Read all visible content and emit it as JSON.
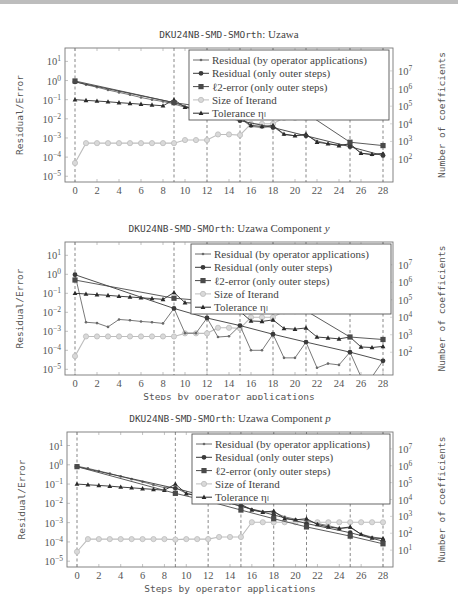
{
  "chart_data": [
    {
      "type": "line",
      "title_mono": "DKU24NB-SMD-SMOrth",
      "title_rest": ": Uzawa",
      "xlabel": "Steps by operator applications",
      "ylabel": "Residual/Error",
      "ylabel_right": "Number of coefficients",
      "x_ticks": [
        "0",
        "2",
        "4",
        "6",
        "8",
        "10",
        "12",
        "14",
        "16",
        "18",
        "20",
        "22",
        "24",
        "26",
        "28"
      ],
      "y_ticks": [
        "10^1",
        "10^0",
        "10^-1",
        "10^-2",
        "10^-3",
        "10^-4",
        "10^-5"
      ],
      "y2_ticks": [
        "10^7",
        "10^6",
        "10^5",
        "10^4",
        "10^3",
        "10^2"
      ],
      "ylim_exp": [
        -5.3,
        1.7
      ],
      "y2lim_exp": [
        0.7,
        8.3
      ],
      "xlim": [
        -0.6,
        28.6
      ],
      "yscale": "log",
      "outer_steps": [
        0,
        9,
        12,
        15,
        18,
        21,
        25,
        28
      ],
      "legend_position": "top-right",
      "legend": [
        "Residual (by operator applications)",
        "Residual (only outer steps)",
        "ℓ2-error (only outer steps)",
        "Size of Iterand",
        "Tolerance ηₗ"
      ],
      "series": [
        {
          "name": "Residual (by operator applications)",
          "marker": "star",
          "axis": "left",
          "x": [
            0,
            1,
            2,
            3,
            4,
            5,
            6,
            7,
            8,
            9,
            10,
            11,
            12,
            13,
            14,
            15,
            16,
            17,
            18,
            19,
            20,
            21,
            22,
            23,
            24,
            25,
            26,
            27,
            28
          ],
          "values": [
            0.9,
            0.6,
            0.45,
            0.32,
            0.24,
            0.18,
            0.13,
            0.1,
            0.08,
            0.06,
            0.04,
            0.03,
            0.025,
            0.018,
            0.014,
            0.011,
            0.004,
            0.0035,
            0.004,
            0.0015,
            0.0013,
            0.0014,
            0.0007,
            0.0005,
            0.00042,
            0.00045,
            0.00016,
            0.00013,
            0.00016
          ]
        },
        {
          "name": "Residual (only outer steps)",
          "marker": "circle",
          "axis": "left",
          "x": [
            0,
            9,
            12,
            15,
            18,
            21,
            25,
            28
          ],
          "values": [
            0.85,
            0.07,
            0.02,
            0.008,
            0.0035,
            0.0013,
            0.00035,
            0.00012
          ]
        },
        {
          "name": "ℓ2-error (only outer steps)",
          "marker": "square",
          "axis": "left",
          "x": [
            0,
            9,
            12,
            15,
            18,
            21,
            25,
            28
          ],
          "values": [
            0.95,
            0.07,
            0.04,
            0.04,
            0.035,
            0.02,
            0.0006,
            0.0004
          ]
        },
        {
          "name": "Size of Iterand",
          "marker": "circle-open",
          "axis": "right",
          "x": [
            0,
            1,
            2,
            3,
            4,
            5,
            6,
            7,
            8,
            9,
            10,
            11,
            12,
            13,
            14,
            15,
            16,
            17,
            18,
            19,
            20,
            21
          ],
          "values": [
            60,
            800,
            800,
            800,
            800,
            800,
            800,
            800,
            800,
            800,
            1200,
            1200,
            1200,
            2500,
            2500,
            2300,
            10000,
            10000,
            10000,
            22000,
            22000,
            22000
          ]
        },
        {
          "name": "Tolerance ηₗ",
          "marker": "triangle",
          "axis": "left",
          "x": [
            0,
            1,
            2,
            3,
            4,
            5,
            6,
            7,
            8,
            9,
            10,
            11,
            12,
            13,
            14,
            15,
            16,
            17,
            18,
            19,
            20,
            21,
            22,
            23,
            24,
            25,
            26,
            27,
            28
          ],
          "values": [
            0.1,
            0.092,
            0.085,
            0.078,
            0.07,
            0.064,
            0.058,
            0.053,
            0.048,
            0.1,
            0.04,
            0.035,
            0.03,
            0.022,
            0.016,
            0.012,
            0.0045,
            0.004,
            0.0045,
            0.0016,
            0.0013,
            0.0016,
            0.0006,
            0.0005,
            0.0004,
            0.0005,
            0.00016,
            0.00014,
            0.00015
          ]
        }
      ]
    },
    {
      "type": "line",
      "title_mono": "DKU24NB-SMD-SMOrth",
      "title_rest": ": Uzawa Component ",
      "title_var": "y",
      "xlabel": "Steps by operator applications",
      "ylabel": "Residual/Error",
      "ylabel_right": "Number of coefficients",
      "x_ticks": [
        "0",
        "2",
        "4",
        "6",
        "8",
        "10",
        "12",
        "14",
        "16",
        "18",
        "20",
        "22",
        "24",
        "26",
        "28"
      ],
      "y_ticks": [
        "10^1",
        "10^0",
        "10^-1",
        "10^-2",
        "10^-3",
        "10^-4",
        "10^-5"
      ],
      "y2_ticks": [
        "10^7",
        "10^6",
        "10^5",
        "10^4",
        "10^3",
        "10^2"
      ],
      "ylim_exp": [
        -5.3,
        1.7
      ],
      "y2lim_exp": [
        0.7,
        8.3
      ],
      "xlim": [
        -0.6,
        28.6
      ],
      "yscale": "log",
      "outer_steps": [
        0,
        9,
        12,
        15,
        18,
        21,
        25,
        28
      ],
      "legend_position": "top-right",
      "legend": [
        "Residual (by operator applications)",
        "Residual (only outer steps)",
        "ℓ2-error (only outer steps)",
        "Size of Iterand",
        "Tolerance ηₗ"
      ],
      "series": [
        {
          "name": "Residual (by operator applications)",
          "marker": "star",
          "axis": "left",
          "x": [
            0,
            1,
            2,
            3,
            4,
            5,
            6,
            7,
            8,
            9,
            10,
            11,
            12,
            13,
            14,
            15,
            16,
            17,
            18,
            19,
            20,
            21,
            22,
            23,
            24,
            25,
            26,
            27,
            28
          ],
          "values": [
            0.95,
            0.003,
            0.0027,
            0.0017,
            0.0042,
            0.0038,
            0.0033,
            0.003,
            0.0026,
            0.016,
            0.0008,
            0.0008,
            0.005,
            0.0005,
            0.00055,
            0.002,
            0.0001,
            0.0001,
            0.0007,
            4e-05,
            4e-05,
            0.00027,
            1.2e-05,
            2e-05,
            1.7e-05,
            8e-05,
            4e-06,
            4e-06,
            2.8e-05
          ]
        },
        {
          "name": "Residual (only outer steps)",
          "marker": "circle",
          "axis": "left",
          "x": [
            0,
            9,
            12,
            15,
            18,
            21,
            25,
            28
          ],
          "values": [
            0.95,
            0.016,
            0.005,
            0.002,
            0.0007,
            0.00027,
            8e-05,
            2.8e-05
          ]
        },
        {
          "name": "ℓ2-error (only outer steps)",
          "marker": "square",
          "axis": "left",
          "x": [
            0,
            9,
            12,
            15,
            18,
            21,
            25,
            28
          ],
          "values": [
            0.5,
            0.055,
            0.04,
            0.03,
            0.025,
            0.012,
            0.0005,
            0.00037
          ]
        },
        {
          "name": "Size of Iterand",
          "marker": "circle-open",
          "axis": "right",
          "x": [
            0,
            1,
            2,
            3,
            4,
            5,
            6,
            7,
            8,
            9,
            10,
            11,
            12,
            13,
            14,
            15,
            16,
            17,
            18,
            19,
            20,
            21
          ],
          "values": [
            60,
            800,
            800,
            800,
            800,
            800,
            800,
            800,
            800,
            800,
            1200,
            1200,
            1200,
            2500,
            2500,
            2300,
            10000,
            10000,
            10000,
            22000,
            22000,
            22000
          ]
        },
        {
          "name": "Tolerance ηₗ",
          "marker": "triangle",
          "axis": "left",
          "x": [
            0,
            1,
            2,
            3,
            4,
            5,
            6,
            7,
            8,
            9,
            10,
            11,
            12,
            13,
            14,
            15,
            16,
            17,
            18,
            19,
            20,
            21,
            22,
            23,
            24,
            25,
            26,
            27,
            28
          ],
          "values": [
            0.1,
            0.092,
            0.085,
            0.078,
            0.07,
            0.064,
            0.058,
            0.053,
            0.048,
            0.11,
            0.032,
            0.03,
            0.028,
            0.02,
            0.015,
            0.011,
            0.0035,
            0.0033,
            0.004,
            0.0014,
            0.0013,
            0.0015,
            0.0005,
            0.00045,
            0.0004,
            0.0005,
            0.00015,
            0.00014,
            0.00016
          ]
        }
      ]
    },
    {
      "type": "line",
      "title_mono": "DKU24NB-SMD-SMOrth",
      "title_rest": ": Uzawa Component ",
      "title_var": "p",
      "xlabel": "Steps by operator applications",
      "ylabel": "Residual/Error",
      "ylabel_right": "Number of coefficients",
      "x_ticks": [
        "0",
        "2",
        "4",
        "6",
        "8",
        "10",
        "12",
        "14",
        "16",
        "18",
        "20",
        "22",
        "24",
        "26",
        "28"
      ],
      "y_ticks": [
        "10^1",
        "10^0",
        "10^-1",
        "10^-2",
        "10^-3",
        "10^-4",
        "10^-5"
      ],
      "y2_ticks": [
        "10^7",
        "10^6",
        "10^5",
        "10^4",
        "10^3",
        "10^2",
        "10^1"
      ],
      "ylim_exp": [
        -5.3,
        1.7
      ],
      "y2lim_exp": [
        0.0,
        8.0
      ],
      "xlim": [
        -0.6,
        28.6
      ],
      "yscale": "log",
      "outer_steps": [
        0,
        9,
        12,
        15,
        18,
        21,
        25,
        28
      ],
      "legend_position": "top-right",
      "legend": [
        "Residual (by operator applications)",
        "Residual (only outer steps)",
        "ℓ2-error (only outer steps)",
        "Size of Iterand",
        "Tolerance ηₗ"
      ],
      "series": [
        {
          "name": "Residual (by operator applications)",
          "marker": "star",
          "axis": "left",
          "x": [
            0,
            1,
            2,
            3,
            4,
            5,
            6,
            7,
            8,
            9,
            10,
            11,
            12,
            13,
            14,
            15,
            16,
            17,
            18,
            19,
            20,
            21,
            22,
            23,
            24,
            25,
            26,
            27,
            28
          ],
          "values": [
            0.85,
            0.65,
            0.48,
            0.35,
            0.25,
            0.18,
            0.13,
            0.09,
            0.065,
            0.065,
            0.033,
            0.025,
            0.019,
            0.014,
            0.01,
            0.0075,
            0.005,
            0.0038,
            0.0035,
            0.002,
            0.0015,
            0.0013,
            0.0009,
            0.0007,
            0.0005,
            0.00055,
            0.00025,
            0.00018,
            0.00015
          ]
        },
        {
          "name": "Residual (only outer steps)",
          "marker": "circle",
          "axis": "left",
          "x": [
            0,
            9,
            12,
            15,
            18,
            21,
            25,
            28
          ],
          "values": [
            0.8,
            0.06,
            0.022,
            0.007,
            0.0025,
            0.0009,
            0.0003,
            0.00011
          ]
        },
        {
          "name": "ℓ2-error (only outer steps)",
          "marker": "square",
          "axis": "left",
          "x": [
            0,
            9,
            12,
            15,
            18,
            21,
            25,
            28
          ],
          "values": [
            0.8,
            0.033,
            0.013,
            0.0045,
            0.0016,
            0.0006,
            0.0002,
            8e-05
          ]
        },
        {
          "name": "Size of Iterand",
          "marker": "circle-open",
          "axis": "right",
          "x": [
            0,
            1,
            2,
            3,
            4,
            5,
            6,
            7,
            8,
            9,
            10,
            11,
            12,
            13,
            14,
            15,
            16,
            17,
            18,
            19,
            20,
            21,
            22,
            23,
            24,
            25,
            26,
            27,
            28
          ],
          "values": [
            8,
            45,
            45,
            45,
            45,
            45,
            45,
            45,
            45,
            42,
            45,
            45,
            45,
            60,
            60,
            60,
            450,
            450,
            450,
            450,
            450,
            450,
            450,
            450,
            450,
            450,
            450,
            450,
            450
          ]
        },
        {
          "name": "Tolerance ηₗ",
          "marker": "triangle",
          "axis": "left",
          "x": [
            0,
            1,
            2,
            3,
            4,
            5,
            6,
            7,
            8,
            9,
            10,
            11,
            12,
            13,
            14,
            15,
            16,
            17,
            18,
            19,
            20,
            21,
            22,
            23,
            24,
            25,
            26,
            27,
            28
          ],
          "values": [
            0.1,
            0.092,
            0.085,
            0.078,
            0.07,
            0.064,
            0.058,
            0.053,
            0.048,
            0.1,
            0.032,
            0.025,
            0.02,
            0.016,
            0.012,
            0.009,
            0.0045,
            0.0035,
            0.004,
            0.0016,
            0.0014,
            0.0016,
            0.0008,
            0.0006,
            0.0005,
            0.0006,
            0.00025,
            0.00016,
            0.00015
          ]
        }
      ]
    }
  ]
}
